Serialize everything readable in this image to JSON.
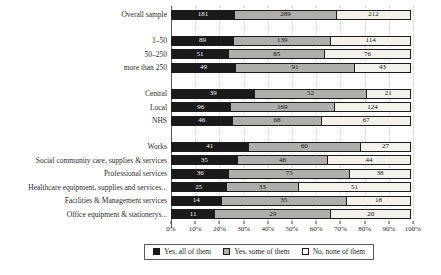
{
  "chart_data": {
    "type": "bar",
    "orientation": "horizontal",
    "stacked": "percent",
    "title": "",
    "xlabel": "",
    "ylabel": "",
    "grid": "vertical-dotted",
    "legend_position": "bottom",
    "series_names": [
      "Yes, all of them",
      "Yes, some of them",
      "No, none of them"
    ],
    "series_colors": [
      "#1a1a1a",
      "#aeaeaa",
      "#f2f1ec"
    ],
    "categories": [
      {
        "label": "Overall sample",
        "values": [
          181,
          289,
          212
        ],
        "group_end": true
      },
      {
        "label": "1–50",
        "values": [
          89,
          139,
          114
        ],
        "group_end": false
      },
      {
        "label": "50–250",
        "values": [
          51,
          85,
          76
        ],
        "group_end": false
      },
      {
        "label": "more than 250",
        "values": [
          49,
          91,
          43
        ],
        "group_end": true
      },
      {
        "label": "Central",
        "values": [
          39,
          52,
          21
        ],
        "group_end": false
      },
      {
        "label": "Local",
        "values": [
          96,
          169,
          124
        ],
        "group_end": false
      },
      {
        "label": "NHS",
        "values": [
          46,
          68,
          67
        ],
        "group_end": true
      },
      {
        "label": "Works",
        "values": [
          41,
          60,
          27
        ],
        "group_end": false
      },
      {
        "label": "Social community care, supplies & services",
        "values": [
          35,
          48,
          44
        ],
        "group_end": false
      },
      {
        "label": "Professional services",
        "values": [
          36,
          75,
          38
        ],
        "group_end": false
      },
      {
        "label": "Healthcare equipment, supplies and services...",
        "values": [
          25,
          33,
          51
        ],
        "group_end": false
      },
      {
        "label": "Facilities & Management services",
        "values": [
          14,
          35,
          18
        ],
        "group_end": false
      },
      {
        "label": "Office equipment & stationerys...",
        "values": [
          11,
          29,
          20
        ],
        "group_end": false
      }
    ],
    "x_ticks": [
      "0%",
      "10%",
      "20%",
      "30%",
      "40%",
      "50%",
      "60%",
      "70%",
      "80%",
      "90%",
      "100%"
    ],
    "xlim": [
      0,
      100
    ],
    "legend": [
      {
        "label": "Yes, all of them",
        "color": "#1a1a1a"
      },
      {
        "label": "Yes, some of them",
        "color": "#aeaeaa"
      },
      {
        "label": "No, none of them",
        "color": "#ffffff"
      }
    ]
  }
}
